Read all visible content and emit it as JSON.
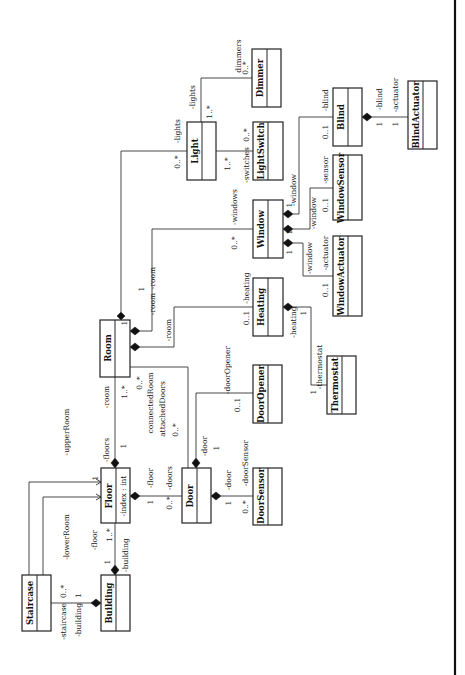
{
  "diagram": {
    "colors": {
      "line": "#333333",
      "box_border": "#222222",
      "background": "#ffffff",
      "diamond": "#111111"
    },
    "classes": [
      {
        "id": "staircase",
        "name": "Staircase",
        "attributes": []
      },
      {
        "id": "building",
        "name": "Building",
        "attributes": []
      },
      {
        "id": "floor",
        "name": "Floor",
        "attributes": [
          "-index : int"
        ]
      },
      {
        "id": "door",
        "name": "Door",
        "attributes": []
      },
      {
        "id": "doorsensor",
        "name": "DoorSensor",
        "attributes": []
      },
      {
        "id": "room",
        "name": "Room",
        "attributes": []
      },
      {
        "id": "dooropener",
        "name": "DoorOpener",
        "attributes": []
      },
      {
        "id": "thermostat",
        "name": "Thermostat",
        "attributes": []
      },
      {
        "id": "heating",
        "name": "Heating",
        "attributes": []
      },
      {
        "id": "window",
        "name": "Window",
        "attributes": []
      },
      {
        "id": "windowactuator",
        "name": "WindowActuator",
        "attributes": []
      },
      {
        "id": "windowsensor",
        "name": "WindowSensor",
        "attributes": []
      },
      {
        "id": "light",
        "name": "Light",
        "attributes": []
      },
      {
        "id": "lightswitch",
        "name": "LightSwitch",
        "attributes": []
      },
      {
        "id": "dimmer",
        "name": "Dimmer",
        "attributes": []
      },
      {
        "id": "blind",
        "name": "Blind",
        "attributes": []
      },
      {
        "id": "blindactuator",
        "name": "BlindActuator",
        "attributes": []
      }
    ],
    "labels": {
      "staircase_role": "-staircase",
      "staircase_mult": "0..*",
      "building_role_stair": "-building",
      "building_mult_stair": "1",
      "lower_room": "-lowerRoom",
      "upper_room": "-upperRoom",
      "upper_mult": "1",
      "lower_mult": "1",
      "floor_role_bld": "-floor",
      "floor_mult_bld": "1..*",
      "building_role_floor": "-building",
      "building_mult_floor": "1",
      "floors_role": "-floors",
      "floors_mult": "1",
      "room_role_floor": "-room",
      "room_mult_floor": "1..*",
      "floor_role_door": "-floor",
      "floor_mult_door": "1",
      "doors_role": "-doors",
      "doors_mult": "0..*",
      "connected_room": "connectedRoom",
      "connected_mult": "0..*",
      "attached_doors": "attachedDoors",
      "attached_mult": "0..*",
      "door_role_room": "-door",
      "door_mult_room": "1",
      "door_role_sensor": "-door",
      "door_mult_sensor": "1",
      "doorsensor_role": "-doorSensor",
      "doorsensor_mult": "0..*",
      "door_role_opener": "-door",
      "door_mult_opener": "1",
      "dooropener_role": "-doorOpener",
      "dooropener_mult": "0..1",
      "room_role_heating": "-room",
      "heating_role": "-heating",
      "heating_mult": "0..1",
      "heating_role_thermo": "-heating",
      "heating_mult_thermo": "1",
      "thermostat_role": "-thermostat",
      "thermostat_mult": "1",
      "room_role_window": "-room",
      "room_mult_window": "1",
      "windows_role": "-windows",
      "windows_mult": "0..*",
      "room_role_light": "-room",
      "room_mult_light": "1",
      "lights_role": "-lights",
      "lights_mult": "0..*",
      "window_role_act": "-window",
      "window_mult_act": "1",
      "actuator_role_win": "-actuator",
      "actuator_mult_win": "0..1",
      "window_role_sensor": "-window",
      "window_mult_sensor": "1",
      "sensor_role": "-sensor",
      "sensor_mult": "0..1",
      "window_role_blind": "-window",
      "window_mult_blind": "1",
      "blind_role": "-blind",
      "blind_mult": "0..1",
      "blind_role_act": "-blind",
      "blind_mult_act": "1",
      "blind_actuator_role": "-actuator",
      "blind_actuator_mult": "1",
      "lights_role_switch": "1..*",
      "switches_role": "-switches",
      "switches_mult": "0..*",
      "lights_role_dimmer": "-lights",
      "lights_mult_dimmer": "1..*",
      "dimmers_role": "dimmers",
      "dimmers_mult": "0..*"
    }
  }
}
